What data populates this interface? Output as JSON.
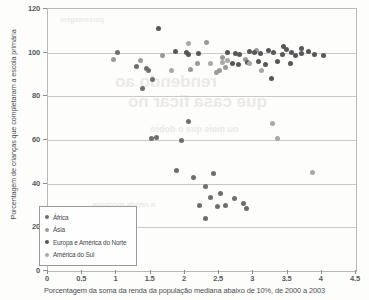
{
  "chart_data": {
    "type": "scatter",
    "title": "",
    "xlabel": "Porcentagem da soma da renda da população mediana abaixo de 10%, de 2000 a 2003",
    "ylabel": "Porcentagem de crianças que completaram a escola primária",
    "xlim": [
      0,
      4.5
    ],
    "ylim": [
      0,
      120
    ],
    "xticks": [
      "0",
      "0.5",
      "1",
      "1.5",
      "2",
      "2.5",
      "3",
      "3.5",
      "4",
      "4.5"
    ],
    "yticks": [
      "0",
      "20",
      "40",
      "60",
      "80",
      "100",
      "120"
    ],
    "grid": "horizontal",
    "legend_position": "inside-lower-left",
    "series": [
      {
        "name": "África",
        "color": "#6e6e6e",
        "points": [
          [
            1.02,
            100.2
          ],
          [
            1.3,
            93.5
          ],
          [
            1.44,
            92.8
          ],
          [
            1.47,
            92.0
          ],
          [
            1.52,
            87.5
          ],
          [
            1.38,
            83.5
          ],
          [
            1.51,
            60.8
          ],
          [
            1.58,
            61.0
          ],
          [
            2.05,
            68.5
          ],
          [
            1.95,
            60.0
          ],
          [
            2.42,
            44.8
          ],
          [
            2.12,
            43.0
          ],
          [
            2.3,
            38.5
          ],
          [
            2.38,
            33.8
          ],
          [
            2.52,
            35.5
          ],
          [
            2.22,
            30.0
          ],
          [
            2.48,
            29.5
          ],
          [
            2.6,
            30.2
          ],
          [
            2.72,
            33.0
          ],
          [
            2.85,
            31.0
          ],
          [
            2.9,
            28.5
          ],
          [
            2.3,
            24.2
          ],
          [
            1.88,
            46.0
          ]
        ]
      },
      {
        "name": "Ásia",
        "color": "#9a9a9a",
        "points": [
          [
            0.95,
            97.0
          ],
          [
            1.67,
            98.5
          ],
          [
            2.18,
            95.0
          ],
          [
            2.08,
            92.5
          ],
          [
            2.55,
            97.8
          ],
          [
            2.6,
            93.0
          ],
          [
            2.5,
            91.8
          ],
          [
            2.88,
            97.0
          ],
          [
            3.05,
            100.8
          ],
          [
            2.32,
            104.5
          ],
          [
            2.46,
            91.0
          ],
          [
            1.35,
            96.5
          ]
        ]
      },
      {
        "name": "Europa e América do Norte",
        "color": "#575757",
        "points": [
          [
            1.62,
            111.0
          ],
          [
            1.86,
            100.5
          ],
          [
            2.02,
            100.2
          ],
          [
            2.05,
            99.0
          ],
          [
            2.2,
            99.5
          ],
          [
            2.62,
            100.0
          ],
          [
            2.74,
            99.8
          ],
          [
            2.8,
            99.2
          ],
          [
            2.95,
            100.5
          ],
          [
            3.02,
            100.0
          ],
          [
            3.1,
            99.4
          ],
          [
            3.22,
            101.0
          ],
          [
            3.3,
            100.3
          ],
          [
            3.42,
            99.0
          ],
          [
            3.48,
            101.5
          ],
          [
            3.56,
            100.2
          ],
          [
            3.62,
            98.5
          ],
          [
            3.7,
            99.8
          ],
          [
            3.8,
            100.4
          ],
          [
            3.9,
            99.2
          ],
          [
            4.02,
            98.8
          ],
          [
            3.36,
            96.0
          ],
          [
            3.55,
            95.0
          ],
          [
            3.18,
            94.5
          ],
          [
            2.92,
            95.5
          ],
          [
            3.44,
            103.0
          ],
          [
            3.7,
            102.0
          ],
          [
            3.26,
            88.0
          ],
          [
            3.08,
            95.8
          ],
          [
            2.7,
            95.2
          ],
          [
            2.78,
            94.8
          ]
        ]
      },
      {
        "name": "América do Sul",
        "color": "#a8a8a8",
        "points": [
          [
            2.38,
            95.0
          ],
          [
            2.55,
            95.5
          ],
          [
            1.8,
            92.0
          ],
          [
            2.05,
            104.0
          ],
          [
            2.62,
            96.5
          ],
          [
            3.12,
            92.0
          ],
          [
            3.86,
            45.0
          ],
          [
            3.35,
            60.5
          ],
          [
            3.28,
            67.5
          ],
          [
            2.95,
            95.0
          ]
        ]
      }
    ]
  },
  "legend": {
    "items": [
      {
        "label": "África"
      },
      {
        "label": "Ásia"
      },
      {
        "label": "Europa e América do Norte"
      },
      {
        "label": "América do Sul"
      }
    ]
  },
  "bleed_text": {
    "line1": "rendendo ao",
    "line2": "que casa ficar no",
    "line3": "ou mais que o dobro",
    "line4": "a renda mediana",
    "line5": "porcentagem"
  }
}
